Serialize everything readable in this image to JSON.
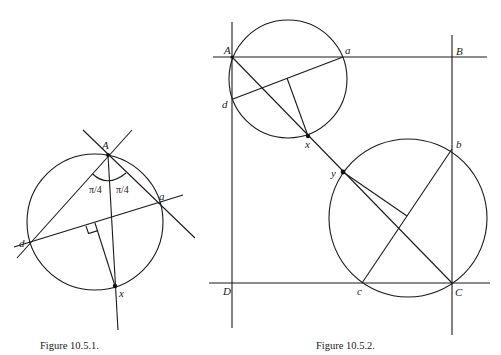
{
  "figure1": {
    "caption": "Figure 10.5.1.",
    "points": {
      "A": "A",
      "a": "a",
      "d": "d",
      "x": "x"
    },
    "angle_left": "π/4",
    "angle_right": "π/4"
  },
  "figure2": {
    "caption": "Figure 10.5.2.",
    "points": {
      "A": "A",
      "a": "a",
      "B": "B",
      "d": "d",
      "x": "x",
      "y": "y",
      "b": "b",
      "c": "c",
      "C": "C",
      "D": "D"
    }
  }
}
